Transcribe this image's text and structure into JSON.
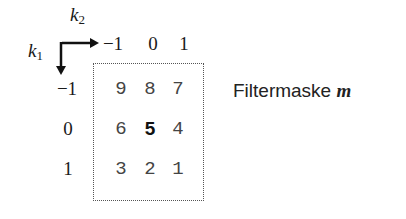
{
  "axes": {
    "k2_label": "k",
    "k2_sub": "2",
    "k1_label": "k",
    "k1_sub": "1",
    "column_ticks": [
      "−1",
      "0",
      "1"
    ],
    "row_ticks": [
      "−1",
      "0",
      "1"
    ]
  },
  "mask": {
    "rows": [
      [
        "9",
        "8",
        "7"
      ],
      [
        "6",
        "5",
        "4"
      ],
      [
        "3",
        "2",
        "1"
      ]
    ],
    "center_value": "5"
  },
  "caption": {
    "text": "Filtermaske",
    "variable": "m"
  }
}
